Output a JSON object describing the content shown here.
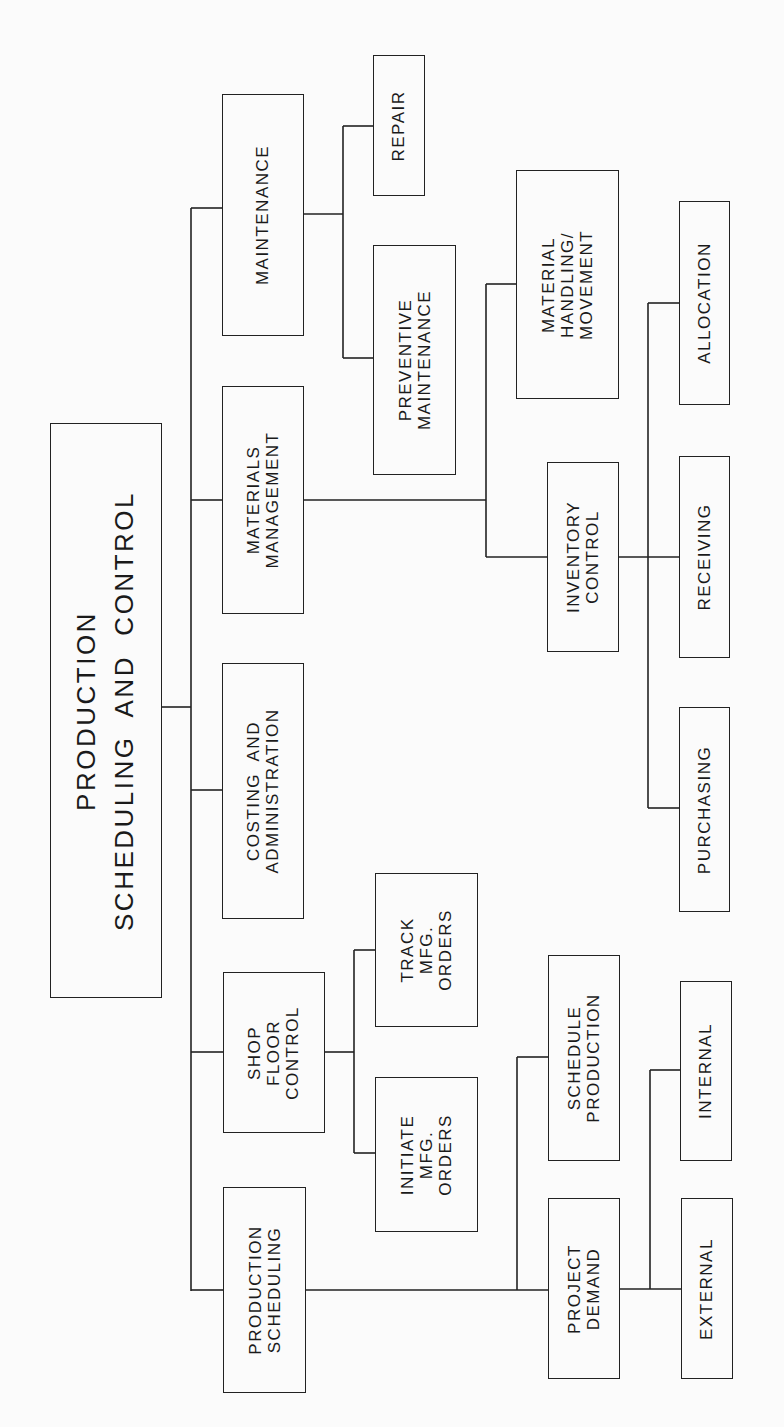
{
  "diagram": {
    "title": "PRODUCTION SCHEDULING AND CONTROL",
    "root": {
      "id": "root",
      "label": "PRODUCTION\nSCHEDULING  AND  CONTROL"
    },
    "level1": [
      {
        "id": "maintenance",
        "label": "MAINTENANCE"
      },
      {
        "id": "materials-management",
        "label": "MATERIALS\nMANAGEMENT"
      },
      {
        "id": "costing-administration",
        "label": "COSTING  AND\nADMINISTRATION"
      },
      {
        "id": "shop-floor-control",
        "label": "SHOP\nFLOOR\nCONTROL"
      },
      {
        "id": "production-scheduling",
        "label": "PRODUCTION\nSCHEDULING"
      }
    ],
    "level2": [
      {
        "id": "repair",
        "parent": "maintenance",
        "label": "REPAIR"
      },
      {
        "id": "preventive-maintenance",
        "parent": "maintenance",
        "label": "PREVENTIVE\nMAINTENANCE"
      },
      {
        "id": "material-handling",
        "parent": "materials-management",
        "label": "MATERIAL\nHANDLING/\nMOVEMENT"
      },
      {
        "id": "inventory-control",
        "parent": "materials-management",
        "label": "INVENTORY\nCONTROL"
      },
      {
        "id": "track-mfg-orders",
        "parent": "shop-floor-control",
        "label": "TRACK\nMFG.\nORDERS"
      },
      {
        "id": "initiate-mfg-orders",
        "parent": "shop-floor-control",
        "label": "INITIATE\nMFG.\nORDERS"
      },
      {
        "id": "schedule-production",
        "parent": "production-scheduling",
        "label": "SCHEDULE\nPRODUCTION"
      },
      {
        "id": "project-demand",
        "parent": "production-scheduling",
        "label": "PROJECT\nDEMAND"
      }
    ],
    "level3": [
      {
        "id": "allocation",
        "parent": "inventory-control",
        "label": "ALLOCATION"
      },
      {
        "id": "receiving",
        "parent": "inventory-control",
        "label": "RECEIVING"
      },
      {
        "id": "purchasing",
        "parent": "inventory-control",
        "label": "PURCHASING"
      },
      {
        "id": "internal",
        "parent": "project-demand",
        "label": "INTERNAL"
      },
      {
        "id": "external",
        "parent": "project-demand",
        "label": "EXTERNAL"
      }
    ]
  }
}
